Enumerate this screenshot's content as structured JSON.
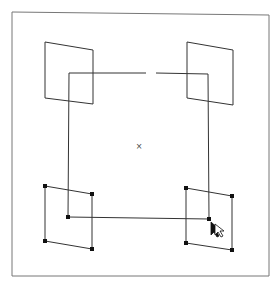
{
  "canvas": {
    "width": 278,
    "height": 286,
    "background": "#ffffff",
    "stroke_color": "#333333",
    "frame_color": "#777777"
  },
  "frame": {
    "points": [
      [
        12,
        12
      ],
      [
        269,
        15
      ],
      [
        269,
        276
      ],
      [
        12,
        276
      ]
    ]
  },
  "center_square": {
    "points": [
      [
        69,
        73
      ],
      [
        208,
        74
      ],
      [
        209,
        219
      ],
      [
        68,
        217
      ]
    ],
    "gap_top": [
      146,
      156
    ]
  },
  "center_marker": {
    "x": 139,
    "y": 146,
    "glyph": "×"
  },
  "parallelograms": [
    {
      "name": "top-left",
      "points": [
        [
          45,
          42
        ],
        [
          93,
          50
        ],
        [
          93,
          104
        ],
        [
          45,
          98
        ]
      ],
      "selected": false
    },
    {
      "name": "top-right",
      "points": [
        [
          187,
          42
        ],
        [
          233,
          50
        ],
        [
          233,
          105
        ],
        [
          187,
          98
        ]
      ],
      "selected": false
    },
    {
      "name": "bottom-left",
      "points": [
        [
          45,
          186
        ],
        [
          92,
          194
        ],
        [
          92,
          249
        ],
        [
          45,
          241
        ]
      ],
      "selected": true
    },
    {
      "name": "bottom-right",
      "points": [
        [
          186,
          188
        ],
        [
          232,
          196
        ],
        [
          232,
          250
        ],
        [
          186,
          243
        ]
      ],
      "selected": true
    }
  ],
  "selected_square_handles": [
    [
      68,
      217
    ],
    [
      209,
      219
    ]
  ],
  "cursor": {
    "x": 211,
    "y": 222,
    "icon": "arrow-cursor-icon"
  }
}
